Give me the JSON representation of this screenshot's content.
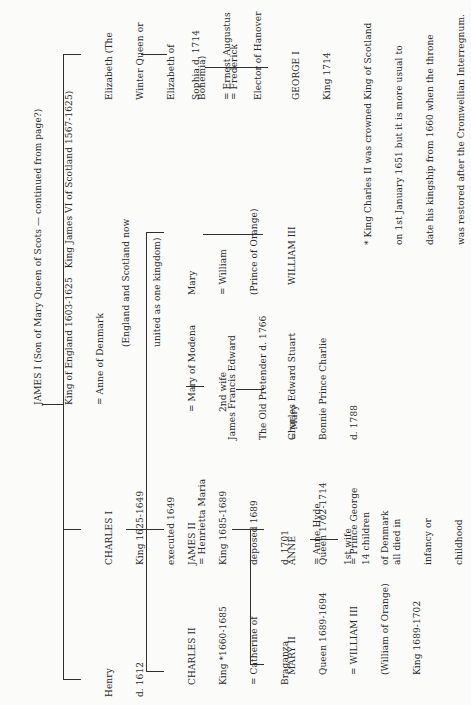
{
  "diagram": {
    "type": "family-tree",
    "orientation": "rotated-90-ccw",
    "root": {
      "lines": [
        "JAMES I (Son of Mary Queen of Scots — continued from page?)",
        "King of England 1603-1625   King James VI of Scotland 1567-1625)",
        "= Anne of Denmark"
      ]
    },
    "union_note": {
      "lines": [
        "(England and Scotland now",
        "united as one kingdom)"
      ]
    },
    "gen1": {
      "henry": {
        "lines": [
          "Henry",
          "d. 1612"
        ]
      },
      "charles_i": {
        "lines": [
          "CHARLES I",
          "King 1625-1649",
          "executed 1649",
          "= Henrietta Maria"
        ]
      },
      "elizabeth": {
        "lines": [
          "Elizabeth (The",
          "Winter Queen or",
          "Elizabeth of",
          "Bohemia)",
          "= Frederick"
        ]
      }
    },
    "gen2": {
      "charles_ii": {
        "lines": [
          "CHARLES II",
          "King *1660-1685",
          "= Catherine of",
          "Braganza"
        ]
      },
      "james_ii": {
        "lines": [
          "JAMES II",
          "King 1685-1689",
          "deposed 1689",
          "d. 1701",
          "= Anne Hyde",
          "1st wife"
        ]
      },
      "mary_of_modena": {
        "lines": [
          "= Mary of Modena",
          "2nd wife"
        ]
      },
      "mary": {
        "lines": [
          "Mary",
          "= William",
          "(Prince of Orange)"
        ]
      },
      "sophia": {
        "lines": [
          "Sophia d. 1714",
          "= Ernest Augustus",
          "Elector of Hanover"
        ]
      }
    },
    "gen3": {
      "mary_ii": {
        "lines": [
          "MARY II",
          "Queen 1689-1694",
          "= WILLIAM III",
          "(William of Orange)",
          "King 1689-1702"
        ]
      },
      "anne": {
        "lines": [
          "ANNE",
          "Queen 1702-1714",
          "= Prince George",
          "of Denmark"
        ]
      },
      "james_francis_edward": {
        "lines": [
          "James Francis Edward",
          "The Old Pretender d. 1766",
          "= Mary"
        ]
      },
      "william_iii": {
        "lines": [
          "WILLIAM III"
        ]
      },
      "george_i": {
        "lines": [
          "GEORGE I",
          "King 1714"
        ]
      }
    },
    "gen4": {
      "anne_children": {
        "lines": [
          "14 children",
          "all died in",
          "infancy or",
          "childhood"
        ]
      },
      "charles_edward_stuart": {
        "lines": [
          "Charles Edward Stuart",
          "Bonnie Prince Charlie",
          "d. 1788"
        ]
      }
    },
    "footnote": {
      "lines": [
        "* King Charles II was crowned King of Scotland",
        "on 1st January 1651 but it is more usual to",
        "date his kingship from 1660 when the throne",
        "was restored after the Cromwellian Interregnum."
      ]
    },
    "colors": {
      "ink": "#2a2a2a",
      "paper": "#fbfbfa"
    }
  }
}
